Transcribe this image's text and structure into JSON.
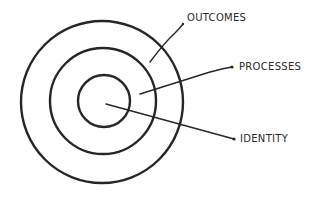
{
  "diagram": {
    "type": "concentric-circles",
    "colors": {
      "stroke": "#262626",
      "text": "#2a2a2a",
      "background": "#ffffff"
    },
    "layers": [
      {
        "name": "outcomes",
        "label": "OUTCOMES",
        "cx": 102,
        "cy": 102,
        "r": 81
      },
      {
        "name": "processes",
        "label": "PROCESSES",
        "cx": 103,
        "cy": 101,
        "r": 53
      },
      {
        "name": "identity",
        "label": "IDENTITY",
        "cx": 104,
        "cy": 101,
        "r": 26
      }
    ],
    "labels": {
      "outcomes": "OUTCOMES",
      "processes": "PROCESSES",
      "identity": "IDENTITY"
    }
  }
}
